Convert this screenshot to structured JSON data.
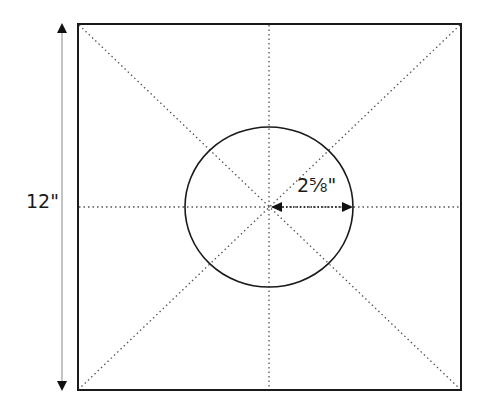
{
  "diagram": {
    "height_dimension": "12\"",
    "radius_dimension": "2⅝\"",
    "colors": {
      "stroke": "#1a1a1a",
      "guide": "#555555",
      "arrow": "#777777",
      "background": "#ffffff"
    },
    "square": {
      "x": 78,
      "y": 24,
      "size": 383
    },
    "circle": {
      "cx": 269,
      "cy": 207,
      "r": 83
    }
  }
}
